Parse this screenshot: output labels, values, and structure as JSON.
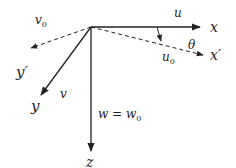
{
  "diagram": {
    "type": "coordinate-axes",
    "colors": {
      "stroke": "#222222",
      "background": "#ffffff"
    },
    "origin": [
      91,
      27
    ],
    "axes": [
      {
        "id": "x",
        "label": "x",
        "style": "solid",
        "from": [
          91,
          27
        ],
        "to": [
          201,
          27
        ]
      },
      {
        "id": "x_prime",
        "label": "x′",
        "style": "dashed",
        "from": [
          91,
          27
        ],
        "to": [
          204,
          55
        ]
      },
      {
        "id": "y",
        "label": "y",
        "style": "solid",
        "from": [
          91,
          27
        ],
        "to": [
          40,
          96
        ]
      },
      {
        "id": "y_prime",
        "label": "y′",
        "style": "dashed",
        "from": [
          91,
          27
        ],
        "to": [
          30,
          48
        ]
      },
      {
        "id": "z",
        "label": "z",
        "style": "solid",
        "from": [
          91,
          27
        ],
        "to": [
          91,
          152
        ]
      }
    ],
    "labels": {
      "x": "x",
      "x_prime": "x′",
      "y": "y",
      "y_prime": "y′",
      "z": "z",
      "u": "u",
      "u0": "u",
      "u0_sub": "0",
      "v": "v",
      "v0": "v",
      "v0_sub": "0",
      "theta": "θ",
      "w_eq": "w = w",
      "w_sub": "0"
    },
    "rotation_arrow": {
      "from": [
        157,
        27
      ],
      "to": [
        161,
        41
      ],
      "label": "θ"
    }
  }
}
